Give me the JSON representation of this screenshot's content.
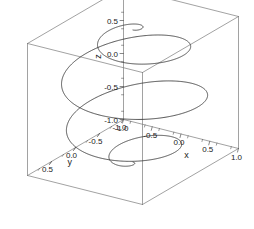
{
  "figure": {
    "title": "",
    "background": "#ffffff",
    "width": 254,
    "height": 229
  },
  "chart_data": {
    "type": "line",
    "plot_kind": "3d-parametric-curve",
    "title": "",
    "xlabel": "x",
    "ylabel": "y",
    "zlabel": "z",
    "xlim": [
      -1.0,
      1.0
    ],
    "ylim": [
      -1.0,
      1.0
    ],
    "zlim": [
      -1.0,
      1.0
    ],
    "xticks": [
      "-1.0",
      "-0.5",
      "0.0",
      "0.5",
      "1.0"
    ],
    "yticks": [
      "0.5",
      "0.0",
      "-0.5",
      "-1.0"
    ],
    "zticks": [
      "1.0",
      "0.5",
      "0.0",
      "-0.5",
      "-1.0"
    ],
    "xtick_values": [
      -1.0,
      -0.5,
      0.0,
      0.5,
      1.0
    ],
    "ytick_values": [
      0.5,
      0.0,
      -0.5,
      -1.0
    ],
    "ztick_values": [
      1.0,
      0.5,
      0.0,
      -0.5,
      -1.0
    ],
    "minor_ticks": true,
    "grid": false,
    "legend": null,
    "box": true,
    "series": [
      {
        "name": "spherical-spiral",
        "color": "#3c3c3c",
        "linewidth": 0.9,
        "equations": {
          "x": "cos(t)*cos(c*t)",
          "y": "sin(t)*cos(c*t)",
          "z": "-sin(c*t)"
        },
        "turns": 8,
        "t_range": [
          -1.5707963,
          1.5707963
        ],
        "samples": 1800
      }
    ],
    "projection": {
      "elevation_deg": 22,
      "azimuth_deg": -56,
      "origin_px": [
        133,
        96
      ],
      "ex_px": [
        57.5,
        14.5
      ],
      "ey_px": [
        -48.0,
        28.0
      ],
      "ez_px": [
        0,
        -66
      ]
    }
  },
  "axes": {
    "z": {
      "label": "z",
      "labels": [
        "1.0",
        "0.5",
        "0.0",
        "-0.5",
        "-1.0"
      ]
    },
    "y": {
      "label": "y",
      "labels": [
        "0.5",
        "0.0",
        "-0.5",
        "-1.0"
      ]
    },
    "x": {
      "label": "x",
      "labels": [
        "-1.0",
        "-0.5",
        "0.0",
        "0.5",
        "1.0"
      ]
    }
  },
  "colors": {
    "curve": "#3c3c3c",
    "box": "#7a7a7a",
    "axis": "#555555",
    "text": "#1a1a1a"
  }
}
